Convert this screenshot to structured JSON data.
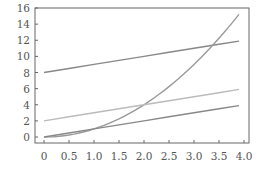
{
  "chart_data": {
    "type": "line",
    "title": "",
    "xlabel": "",
    "ylabel": "",
    "xlim": [
      -0.2,
      4.1
    ],
    "ylim": [
      -0.7,
      16
    ],
    "grid": false,
    "legend": null,
    "x_ticks": [
      "0",
      "0.5",
      "1.0",
      "1.5",
      "2.0",
      "2.5",
      "3.0",
      "3.5",
      "4.0"
    ],
    "x_tick_values": [
      0,
      0.5,
      1.0,
      1.5,
      2.0,
      2.5,
      3.0,
      3.5,
      4.0
    ],
    "y_ticks": [
      "0",
      "2",
      "4",
      "6",
      "8",
      "10",
      "12",
      "14",
      "16"
    ],
    "y_tick_values": [
      0,
      2,
      4,
      6,
      8,
      10,
      12,
      14,
      16
    ],
    "x": [
      0,
      0.5,
      1.0,
      1.5,
      2.0,
      2.5,
      3.0,
      3.5,
      3.9
    ],
    "series": [
      {
        "name": "x + 8",
        "color": "#888888",
        "values": [
          8,
          8.5,
          9,
          9.5,
          10,
          10.5,
          11,
          11.5,
          11.9
        ]
      },
      {
        "name": "x^2",
        "color": "#999999",
        "values": [
          0,
          0.25,
          1,
          2.25,
          4,
          6.25,
          9,
          12.25,
          15.21
        ]
      },
      {
        "name": "x + 2",
        "color": "#bbbbbb",
        "values": [
          2,
          2.5,
          3,
          3.5,
          4,
          4.5,
          5,
          5.5,
          5.9
        ]
      },
      {
        "name": "x",
        "color": "#888888",
        "values": [
          0,
          0.5,
          1,
          1.5,
          2,
          2.5,
          3,
          3.5,
          3.9
        ]
      }
    ]
  }
}
